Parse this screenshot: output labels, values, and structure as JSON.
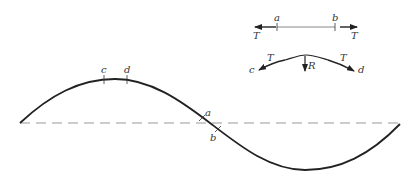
{
  "diagram": {
    "main_wave": {
      "type": "sine",
      "baseline": "dashed",
      "marks": {
        "c": "c",
        "d": "d",
        "a": "a",
        "b": "b"
      }
    },
    "inset_straight": {
      "left_point": "a",
      "right_point": "b",
      "left_force": "T",
      "right_force": "T"
    },
    "inset_curved": {
      "left_point": "c",
      "right_point": "d",
      "left_force": "T",
      "right_force": "T",
      "resultant": "R"
    },
    "colors": {
      "curve": "#222222",
      "dashed": "#999999",
      "inset_line": "#888888"
    }
  }
}
